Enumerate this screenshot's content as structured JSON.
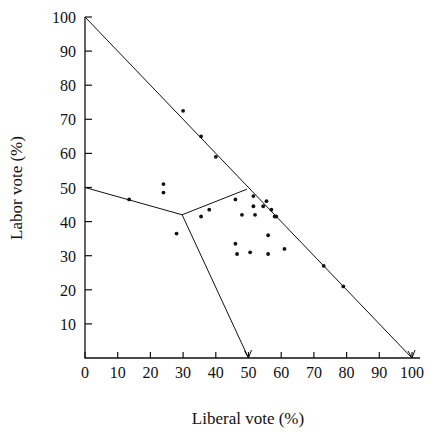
{
  "chart_data": {
    "type": "scatter",
    "title": "",
    "xlabel": "Liberal vote (%)",
    "ylabel": "Labor vote (%)",
    "xlim": [
      0,
      100
    ],
    "ylim": [
      0,
      100
    ],
    "xticks": [
      0,
      10,
      20,
      30,
      40,
      50,
      60,
      70,
      80,
      90,
      100
    ],
    "yticks": [
      10,
      20,
      30,
      40,
      50,
      60,
      70,
      80,
      90,
      100
    ],
    "xtick_labels": [
      "0",
      "10",
      "20",
      "30",
      "40",
      "50",
      "60",
      "70",
      "80",
      "90",
      "100"
    ],
    "ytick_labels": [
      "10",
      "20",
      "30",
      "40",
      "50",
      "60",
      "70",
      "80",
      "90",
      "100"
    ],
    "grid": false,
    "legend": false,
    "series": [
      {
        "name": "constituencies",
        "marker": "dot",
        "color": "#111111",
        "points": [
          [
            24.0,
            51.0
          ],
          [
            24.0,
            48.5
          ],
          [
            13.5,
            46.5
          ],
          [
            28.0,
            36.5
          ],
          [
            35.5,
            41.5
          ],
          [
            38.0,
            43.5
          ],
          [
            46.0,
            46.5
          ],
          [
            48.0,
            42.0
          ],
          [
            51.5,
            47.5
          ],
          [
            51.5,
            44.5
          ],
          [
            52.0,
            42.0
          ],
          [
            54.5,
            44.5
          ],
          [
            55.5,
            46.0
          ],
          [
            57.0,
            43.5
          ],
          [
            58.5,
            41.5
          ],
          [
            56.0,
            36.0
          ],
          [
            46.0,
            33.5
          ],
          [
            46.5,
            30.5
          ],
          [
            50.5,
            31.0
          ],
          [
            56.0,
            30.5
          ],
          [
            61.0,
            32.0
          ],
          [
            30.0,
            72.5
          ],
          [
            35.5,
            65.0
          ],
          [
            40.0,
            59.0
          ],
          [
            58.0,
            41.5
          ],
          [
            73.0,
            27.0
          ],
          [
            79.0,
            21.0
          ]
        ]
      }
    ],
    "boundaries": [
      {
        "name": "triangle-hypotenuse",
        "vertices": [
          [
            0,
            100
          ],
          [
            100,
            0
          ]
        ]
      },
      {
        "name": "labor-liberal-divider",
        "vertices": [
          [
            0,
            50
          ],
          [
            29.7,
            42.0
          ],
          [
            49.5,
            49.5
          ]
        ]
      },
      {
        "name": "liberal-other-divider",
        "vertices": [
          [
            29.7,
            42.0
          ],
          [
            50.0,
            0
          ]
        ]
      }
    ],
    "annotations": []
  },
  "axes": {
    "y_axis_title": "Labor vote (%)",
    "x_axis_title": "Liberal vote (%)"
  },
  "colors": {
    "ink": "#111111",
    "background": "#ffffff"
  }
}
